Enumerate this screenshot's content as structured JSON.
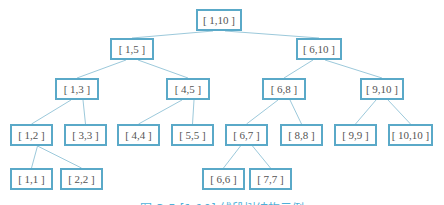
{
  "diagram": {
    "type": "segment-tree",
    "border_color": "#5aa9c8",
    "edge_color": "#9cc9db",
    "nodes": [
      {
        "id": "n1_10",
        "label": "[ 1,10 ]",
        "x": 196,
        "y": 9,
        "w": 46
      },
      {
        "id": "n1_5",
        "label": "[ 1,5 ]",
        "x": 110,
        "y": 38,
        "w": 44
      },
      {
        "id": "n6_10",
        "label": "[ 6,10 ]",
        "x": 296,
        "y": 38,
        "w": 46
      },
      {
        "id": "n1_3",
        "label": "[ 1,3 ]",
        "x": 55,
        "y": 78,
        "w": 44
      },
      {
        "id": "n4_5",
        "label": "[ 4,5 ]",
        "x": 166,
        "y": 78,
        "w": 44
      },
      {
        "id": "n6_8",
        "label": "[ 6,8 ]",
        "x": 262,
        "y": 78,
        "w": 44
      },
      {
        "id": "n9_10",
        "label": "[ 9,10 ]",
        "x": 360,
        "y": 78,
        "w": 44
      },
      {
        "id": "n1_2",
        "label": "[ 1,2 ]",
        "x": 10,
        "y": 124,
        "w": 43
      },
      {
        "id": "n3_3",
        "label": "[ 3,3 ]",
        "x": 64,
        "y": 124,
        "w": 43
      },
      {
        "id": "n4_4",
        "label": "[ 4,4 ]",
        "x": 117,
        "y": 124,
        "w": 43
      },
      {
        "id": "n5_5",
        "label": "[ 5,5 ]",
        "x": 171,
        "y": 124,
        "w": 43
      },
      {
        "id": "n6_7",
        "label": "[ 6,7 ]",
        "x": 225,
        "y": 124,
        "w": 43
      },
      {
        "id": "n8_8",
        "label": "[ 8,8 ]",
        "x": 280,
        "y": 124,
        "w": 43
      },
      {
        "id": "n9_9",
        "label": "[ 9,9 ]",
        "x": 334,
        "y": 124,
        "w": 43
      },
      {
        "id": "n10_10",
        "label": "[ 10,10 ]",
        "x": 388,
        "y": 124,
        "w": 45
      },
      {
        "id": "n1_1",
        "label": "[ 1,1 ]",
        "x": 10,
        "y": 168,
        "w": 43
      },
      {
        "id": "n2_2",
        "label": "[ 2,2 ]",
        "x": 60,
        "y": 168,
        "w": 43
      },
      {
        "id": "n6_6",
        "label": "[ 6,6 ]",
        "x": 202,
        "y": 168,
        "w": 43
      },
      {
        "id": "n7_7",
        "label": "[ 7,7 ]",
        "x": 249,
        "y": 168,
        "w": 43
      }
    ],
    "edges": [
      [
        "n1_10",
        "n1_5"
      ],
      [
        "n1_10",
        "n6_10"
      ],
      [
        "n1_5",
        "n1_3"
      ],
      [
        "n1_5",
        "n4_5"
      ],
      [
        "n6_10",
        "n6_8"
      ],
      [
        "n6_10",
        "n9_10"
      ],
      [
        "n1_3",
        "n1_2"
      ],
      [
        "n1_3",
        "n3_3"
      ],
      [
        "n4_5",
        "n4_4"
      ],
      [
        "n4_5",
        "n5_5"
      ],
      [
        "n6_8",
        "n6_7"
      ],
      [
        "n6_8",
        "n8_8"
      ],
      [
        "n9_10",
        "n9_9"
      ],
      [
        "n9_10",
        "n10_10"
      ],
      [
        "n1_2",
        "n1_1"
      ],
      [
        "n1_2",
        "n2_2"
      ],
      [
        "n6_7",
        "n6_6"
      ],
      [
        "n6_7",
        "n7_7"
      ]
    ]
  },
  "caption": "图 3-5  [1,10] 线段树结构示例"
}
